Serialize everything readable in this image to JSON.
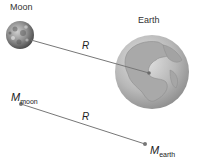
{
  "diagram": {
    "top": {
      "moon_label": "Moon",
      "earth_label": "Earth",
      "distance_label": "R",
      "moon": {
        "cx": 20,
        "cy": 35,
        "r": 14
      },
      "earth": {
        "cx": 152,
        "cy": 72,
        "r": 37
      },
      "line": {
        "x1": 31,
        "y1": 40,
        "x2": 149,
        "y2": 73
      }
    },
    "bottom": {
      "moon_mass_symbol": "M",
      "moon_mass_subscript": "moon",
      "earth_mass_symbol": "M",
      "earth_mass_subscript": "earth",
      "distance_label": "R",
      "moon_point": {
        "x": 21,
        "y": 104
      },
      "earth_point": {
        "x": 145,
        "y": 144
      }
    },
    "colors": {
      "line": "#777777",
      "point": "#777777",
      "earth_base": "#bdbdbd",
      "moon_base": "#8a8a8a"
    }
  }
}
